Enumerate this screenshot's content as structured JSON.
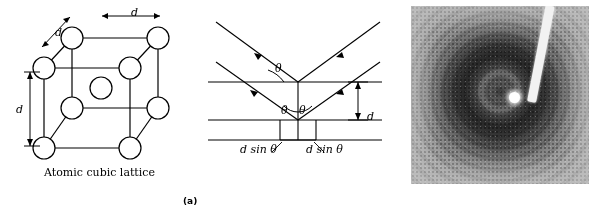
{
  "figure": {
    "panels": [
      {
        "id": "a",
        "caption": "(a)",
        "diagrams": [
          {
            "id": "atomic-cubic-lattice",
            "caption": "Atomic cubic lattice",
            "labels": [
              {
                "name": "d-top",
                "text": "d"
              },
              {
                "name": "d-left-edge",
                "text": "d"
              },
              {
                "name": "d-vertical",
                "text": "d"
              }
            ],
            "atoms": 9
          },
          {
            "id": "bragg-reflection",
            "labels": [
              {
                "name": "theta-incident",
                "text": "θ"
              },
              {
                "name": "theta-left",
                "text": "θ"
              },
              {
                "name": "theta-right",
                "text": "θ"
              },
              {
                "name": "spacing-d",
                "text": "d"
              },
              {
                "name": "path-left",
                "text": "d sin θ"
              },
              {
                "name": "path-right",
                "text": "d sin θ"
              }
            ]
          }
        ]
      },
      {
        "id": "b",
        "caption": "(b)",
        "image": {
          "name": "x-ray-diffraction-pattern",
          "description": "Debye-Scherrer powder diffraction photograph with concentric rings, beamstop shadow and central beam spot"
        }
      }
    ]
  },
  "colors": {
    "ink": "#000000",
    "background": "#ffffff",
    "film_mid_gray": "#8f8f8f",
    "beamstop": "#f2f2f2"
  }
}
